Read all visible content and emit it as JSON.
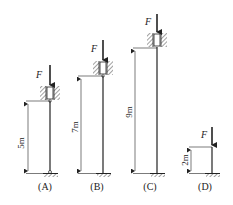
{
  "figure": {
    "colors": {
      "line": "#222222",
      "hatch": "#444444",
      "background": "#ffffff"
    },
    "columns": [
      {
        "id": "A",
        "label": "(A)",
        "force_label": "F",
        "length_label": "5m",
        "top_support": "sliding guide (hatched walls)",
        "bottom_support": "pinned"
      },
      {
        "id": "B",
        "label": "(B)",
        "force_label": "F",
        "length_label": "7m",
        "top_support": "sliding guide (hatched walls)",
        "bottom_support": "fixed"
      },
      {
        "id": "C",
        "label": "(C)",
        "force_label": "F",
        "length_label": "9m",
        "top_support": "sliding guide (hatched walls)",
        "bottom_support": "fixed"
      },
      {
        "id": "D",
        "label": "(D)",
        "force_label": "F",
        "length_label": "2m",
        "top_support": "free",
        "bottom_support": "fixed"
      }
    ]
  }
}
